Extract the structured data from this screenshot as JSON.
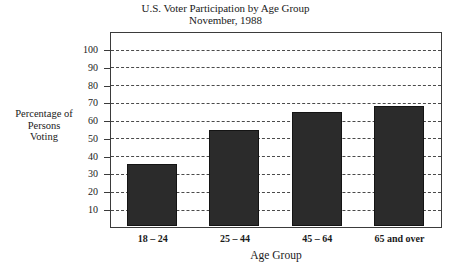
{
  "chart_data": {
    "type": "bar",
    "title": "U.S. Voter Participation by Age Group",
    "subtitle": "November, 1988",
    "xlabel": "Age Group",
    "ylabel": "Percentage of Persons Voting",
    "ylabel_lines": [
      "Percentage of",
      "Persons",
      "Voting"
    ],
    "categories": [
      "18 – 24",
      "25 – 44",
      "45 – 64",
      "65 and over"
    ],
    "values": [
      35.5,
      54.5,
      65,
      68.5
    ],
    "ylim": [
      0,
      105
    ],
    "yticks": [
      10,
      20,
      30,
      40,
      50,
      60,
      70,
      80,
      90,
      100
    ],
    "ytick_labels": [
      "10",
      "20",
      "30",
      "40",
      "50",
      "60",
      "70",
      "80",
      "90",
      "100"
    ],
    "grid": true,
    "grid_style": "dashed",
    "legend": null,
    "bar_color": "#2b2b2b",
    "bar_edge_color": "#141414",
    "frame_color": "#3b3b3b",
    "grid_color": "#4a4a4a",
    "background": "#ffffff"
  }
}
